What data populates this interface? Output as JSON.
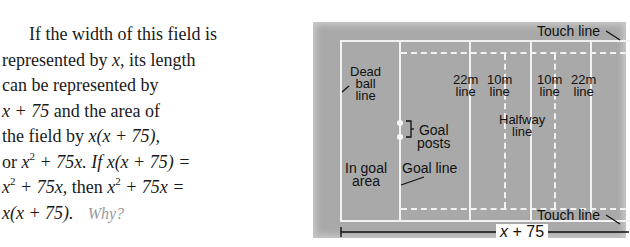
{
  "paragraph": {
    "lines": [
      "If the width of this field is",
      "represented by ",
      "can be represented by",
      "and the area of",
      "the field by ",
      "or ",
      "then ",
      "Why?"
    ],
    "text": "If the width of this field is represented by x, its length can be represented by x + 75 and the area of the field by x(x + 75), or x^2 + 75x. If x(x + 75) = x^2 + 75x, then x^2 + 75x = x(x + 75). Why?",
    "var_x": "x",
    "its_length": ", its length",
    "expr_x_plus_75": "x + 75",
    "expr_area": "x(x + 75),",
    "expr_x": "x",
    "sup_2": "2",
    "plus_75x": " + 75x. If ",
    "eq_1": "x(x + 75) =",
    "plus_75x_comma": " + 75x, ",
    "plus_75x_eq": " + 75x =",
    "final_expr": "x(x + 75).",
    "why": "Why?"
  },
  "diagram": {
    "labels": {
      "touch_line_top": "Touch line",
      "touch_line_bottom": "Touch line",
      "dead_ball_line": [
        "Dead",
        "ball",
        "line"
      ],
      "line_22m_left": [
        "22m",
        "line"
      ],
      "line_10m_left": [
        "10m",
        "line"
      ],
      "line_10m_right": [
        "10m",
        "line"
      ],
      "line_22m_right": [
        "22m",
        "line"
      ],
      "halfway_line": [
        "Halfway",
        "line"
      ],
      "goal_posts": [
        "Goal",
        "posts"
      ],
      "in_goal_area": [
        "In goal",
        "area"
      ],
      "goal_line": "Goal line"
    },
    "dimension": {
      "var": "x",
      "rest": " + 75"
    },
    "colors": {
      "field": "#a9a9a9",
      "lines": "#f2f2f2",
      "text": "#111111"
    }
  }
}
